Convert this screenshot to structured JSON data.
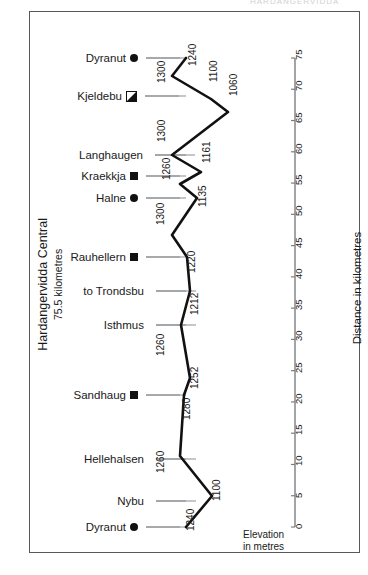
{
  "top_caption": "HARDANGERVIDDA",
  "frame": {
    "border_color": "#55585c"
  },
  "left_title": {
    "line1": "Hardangervidda Central",
    "line2": "75.5 kilometres"
  },
  "axis_title": "Distance in kilometres",
  "elevation_caption": {
    "line1": "Elevation",
    "line2": "in metres"
  },
  "colors": {
    "line": "#111111",
    "leader": "#8a8d90",
    "axis": "#7b7e81",
    "text": "#1a1a1a"
  },
  "chart_data": {
    "type": "line",
    "title": "Hardangervidda Central 75.5 kilometres",
    "xlabel": "Elevation in metres",
    "ylabel": "Distance in kilometres",
    "ylim": [
      0,
      78
    ],
    "grid": false,
    "orientation": "vertical-profile",
    "axis_ticks": [
      0,
      5,
      10,
      15,
      20,
      25,
      30,
      35,
      40,
      45,
      50,
      55,
      60,
      65,
      70,
      75
    ],
    "points": [
      {
        "name": "Dyranut",
        "marker": "circle",
        "elevation": 1240,
        "distance_km": 75.5,
        "elev_px": 186,
        "y_px": 58,
        "label_px": 198,
        "label_y": 55
      },
      {
        "name": "",
        "marker": "none",
        "elevation": 1300,
        "distance_km": 73.0,
        "elev_px": 172,
        "y_px": 76,
        "label_px": 167,
        "label_y": 72
      },
      {
        "name": "Kjeldebu",
        "marker": "half",
        "elevation": 1100,
        "distance_km": 69.5,
        "elev_px": 211,
        "y_px": 99,
        "label_px": 219,
        "label_y": 71
      },
      {
        "name": "",
        "marker": "none",
        "elevation": 1060,
        "distance_km": 67.5,
        "elev_px": 228,
        "y_px": 112,
        "label_px": 239,
        "label_y": 85
      },
      {
        "name": "Langhaugen",
        "marker": "none",
        "elevation": 1300,
        "distance_km": 60.5,
        "elev_px": 172,
        "y_px": 155,
        "label_px": 167,
        "label_y": 131
      },
      {
        "name": "",
        "marker": "none",
        "elevation": 1161,
        "distance_km": 57.5,
        "elev_px": 201,
        "y_px": 172,
        "label_px": 212,
        "label_y": 152
      },
      {
        "name": "Kraekkja",
        "marker": "square",
        "elevation": 1260,
        "distance_km": 55.5,
        "elev_px": 180,
        "y_px": 184,
        "label_px": 172,
        "label_y": 169
      },
      {
        "name": "Halne",
        "marker": "circle",
        "elevation": 1135,
        "distance_km": 52.0,
        "elev_px": 197,
        "y_px": 198,
        "label_px": 208,
        "label_y": 196
      },
      {
        "name": "",
        "marker": "none",
        "elevation": 1300,
        "distance_km": 45.5,
        "elev_px": 172,
        "y_px": 235,
        "label_px": 166,
        "label_y": 214
      },
      {
        "name": "Rauhellern",
        "marker": "square",
        "elevation": 1220,
        "distance_km": 42.5,
        "elev_px": 187,
        "y_px": 257,
        "label_px": 197,
        "label_y": 262
      },
      {
        "name": "to Trondsbu",
        "marker": "none",
        "elevation": 1212,
        "distance_km": 36.5,
        "elev_px": 190,
        "y_px": 291,
        "label_px": 200,
        "label_y": 304
      },
      {
        "name": "Isthmus",
        "marker": "none",
        "elevation": 1260,
        "distance_km": 30.5,
        "elev_px": 181,
        "y_px": 325,
        "label_px": 166,
        "label_y": 345
      },
      {
        "name": "",
        "marker": "none",
        "elevation": 1252,
        "distance_km": 24.0,
        "elev_px": 190,
        "y_px": 378,
        "label_px": 200,
        "label_y": 378
      },
      {
        "name": "Sandhaug",
        "marker": "square",
        "elevation": 1280,
        "distance_km": 21.5,
        "elev_px": 184,
        "y_px": 395,
        "label_px": 192,
        "label_y": 409
      },
      {
        "name": "",
        "marker": "none",
        "elevation": 1260,
        "distance_km": 10.0,
        "elev_px": 180,
        "y_px": 456,
        "label_px": 166,
        "label_y": 462
      },
      {
        "name": "Hellehalsen",
        "marker": "none",
        "elevation": 1100,
        "distance_km": 5.0,
        "elev_px": 212,
        "y_px": 496,
        "label_px": 222,
        "label_y": 490
      },
      {
        "name": "Nybu",
        "marker": "none",
        "elevation": 1240,
        "distance_km": 0.0,
        "elev_px": 186,
        "y_px": 527,
        "label_px": 196,
        "label_y": 520
      }
    ],
    "labelled_places": [
      {
        "name": "Dyranut",
        "marker": "circle",
        "y_px": 58,
        "name_right": 138
      },
      {
        "name": "Kjeldebu",
        "marker": "half",
        "y_px": 96,
        "name_right": 137
      },
      {
        "name": "Langhaugen",
        "marker": "none",
        "y_px": 155,
        "name_right": 147
      },
      {
        "name": "Kraekkja",
        "marker": "square",
        "y_px": 176,
        "name_right": 138
      },
      {
        "name": "Halne",
        "marker": "circle",
        "y_px": 198,
        "name_right": 138
      },
      {
        "name": "Rauhellern",
        "marker": "square",
        "y_px": 257,
        "name_right": 138
      },
      {
        "name": "to Trondsbu",
        "marker": "none",
        "y_px": 291,
        "name_right": 148
      },
      {
        "name": "Isthmus",
        "marker": "none",
        "y_px": 325,
        "name_right": 148
      },
      {
        "name": "Sandhaug",
        "marker": "square",
        "y_px": 395,
        "name_right": 138
      },
      {
        "name": "Hellehalsen",
        "marker": "none",
        "y_px": 459,
        "name_right": 148
      },
      {
        "name": "Nybu",
        "marker": "none",
        "y_px": 501,
        "name_right": 148
      },
      {
        "name": "Dyranut",
        "marker": "circle",
        "y_px": 527,
        "name_right": 138
      }
    ],
    "elevation_labels": [
      1240,
      1300,
      1100,
      1060,
      1300,
      1161,
      1260,
      1135,
      1300,
      1220,
      1212,
      1260,
      1252,
      1280,
      1260,
      1100,
      1240
    ]
  }
}
